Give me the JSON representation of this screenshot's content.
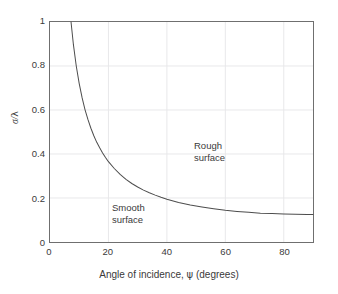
{
  "chart_data": {
    "type": "line",
    "title": "",
    "xlabel": "Angle of incidence, ψ (degrees)",
    "ylabel": "σ/λ",
    "xlim": [
      0,
      90
    ],
    "ylim": [
      0,
      1
    ],
    "grid": true,
    "legend": null,
    "xticks": [
      0,
      20,
      40,
      60,
      80
    ],
    "xtick_labels": [
      "0",
      "20",
      "40",
      "60",
      "80"
    ],
    "yticks": [
      0,
      0.2,
      0.4,
      0.6,
      0.8,
      1
    ],
    "ytick_labels": [
      "0",
      "0.2",
      "0.4",
      "0.6",
      "0.8",
      "1"
    ],
    "series": [
      {
        "name": "Rayleigh roughness criterion",
        "equation": "σ/λ = 1/(8 sin ψ)",
        "color": "#4d4d4d",
        "x": [
          7.2,
          8,
          9,
          10,
          11,
          12,
          13,
          14,
          15,
          16,
          17,
          18,
          19,
          20,
          22,
          24,
          26,
          28,
          30,
          32,
          34,
          36,
          38,
          40,
          44,
          48,
          52,
          56,
          60,
          64,
          68,
          72,
          76,
          80,
          84,
          88,
          90
        ],
        "y": [
          1.0,
          0.898,
          0.799,
          0.72,
          0.655,
          0.601,
          0.556,
          0.517,
          0.483,
          0.453,
          0.428,
          0.405,
          0.384,
          0.365,
          0.334,
          0.307,
          0.285,
          0.266,
          0.25,
          0.236,
          0.224,
          0.213,
          0.203,
          0.194,
          0.18,
          0.168,
          0.159,
          0.151,
          0.144,
          0.139,
          0.135,
          0.131,
          0.129,
          0.127,
          0.126,
          0.125,
          0.125
        ]
      }
    ],
    "annotations": [
      {
        "id": "rough",
        "lines": [
          "Rough",
          "surface"
        ],
        "x": 32,
        "y": 0.56
      },
      {
        "id": "smooth",
        "lines": [
          "Smooth",
          "surface"
        ],
        "x": 4.5,
        "y": 0.28
      }
    ]
  },
  "axes": {
    "y": {
      "label_sigma": "σ",
      "label_slash": "/",
      "label_lambda": "λ",
      "ticks": [
        {
          "value": 1,
          "label": "1"
        },
        {
          "value": 0.8,
          "label": "0.8"
        },
        {
          "value": 0.6,
          "label": "0.6"
        },
        {
          "value": 0.4,
          "label": "0.4"
        },
        {
          "value": 0.2,
          "label": "0.2"
        },
        {
          "value": 0,
          "label": "0"
        }
      ]
    },
    "x": {
      "title_pre": "Angle of incidence, ",
      "title_symbol": "ψ",
      "title_post": " (degrees)",
      "ticks": [
        {
          "value": 0,
          "label": "0"
        },
        {
          "value": 20,
          "label": "20"
        },
        {
          "value": 40,
          "label": "40"
        },
        {
          "value": 60,
          "label": "60"
        },
        {
          "value": 80,
          "label": "80"
        }
      ]
    }
  },
  "annotations": {
    "rough": {
      "line1": "Rough",
      "line2": "surface"
    },
    "smooth": {
      "line1": "Smooth",
      "line2": "surface"
    }
  },
  "colors": {
    "curve": "#4d4d4d",
    "frame": "#6f6f6f",
    "grid": "#e8e8ea",
    "text": "#3a3a3a",
    "background": "#ffffff"
  }
}
